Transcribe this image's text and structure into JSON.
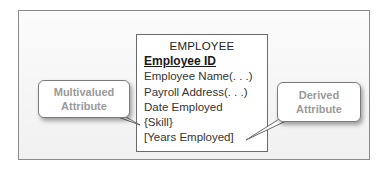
{
  "diagram": {
    "entity": {
      "name": "EMPLOYEE",
      "identifier": "Employee ID",
      "attributes": [
        "Employee Name(. . .)",
        "Payroll Address(. . .)",
        "Date Employed",
        "{Skill}",
        "[Years Employed]"
      ]
    },
    "callouts": {
      "left": {
        "line1": "Multivalued",
        "line2": "Attribute",
        "points_to": "{Skill}"
      },
      "right": {
        "line1": "Derived",
        "line2": "Attribute",
        "points_to": "[Years Employed]"
      }
    },
    "colors": {
      "border": "#6a6a6a",
      "callout_text": "#9a9a9a",
      "text": "#333333",
      "frame_bg": "#f4f4f4"
    }
  }
}
